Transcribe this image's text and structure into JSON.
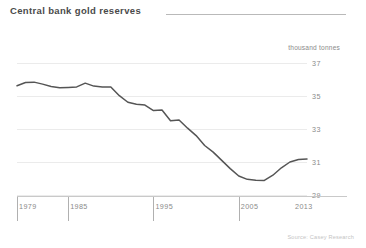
{
  "header": {
    "title": "Central bank gold reserves"
  },
  "footer": {
    "source": "Source: Casey Research"
  },
  "chart_data": {
    "type": "line",
    "title": "Central bank gold reserves",
    "subtitle": "",
    "xlabel": "",
    "ylabel": "thousand tonnes",
    "unit_label": "thousand tonnes",
    "legend": [],
    "legend_position": "none",
    "grid": true,
    "xlim": [
      1979,
      2013
    ],
    "ylim": [
      29,
      37
    ],
    "yticks": [
      37,
      35,
      33,
      31,
      29
    ],
    "ytick_labels": [
      "37",
      "35",
      "33",
      "31",
      "29"
    ],
    "xticks": [
      1979,
      1985,
      1995,
      2005,
      2013
    ],
    "xtick_labels": [
      "1979",
      "1985",
      "1995",
      "2005",
      "2013"
    ],
    "line_color": "#555555",
    "grid_color": "#ebebeb",
    "axis_color": "#c9c9c9",
    "x": [
      1979,
      1980,
      1981,
      1982,
      1983,
      1984,
      1985,
      1986,
      1987,
      1988,
      1989,
      1990,
      1991,
      1992,
      1993,
      1994,
      1995,
      1996,
      1997,
      1998,
      1999,
      2000,
      2001,
      2002,
      2003,
      2004,
      2005,
      2006,
      2007,
      2008,
      2009,
      2010,
      2011,
      2012,
      2013
    ],
    "values": [
      35.62,
      35.82,
      35.84,
      35.72,
      35.58,
      35.5,
      35.52,
      35.55,
      35.78,
      35.6,
      35.55,
      35.55,
      35.02,
      34.62,
      34.5,
      34.45,
      34.12,
      34.15,
      33.5,
      33.55,
      33.05,
      32.6,
      32.0,
      31.6,
      31.1,
      30.6,
      30.15,
      29.95,
      29.9,
      29.88,
      30.2,
      30.65,
      31.0,
      31.15,
      31.18
    ],
    "series": [
      {
        "name": "Central bank gold reserves",
        "values": [
          35.62,
          35.82,
          35.84,
          35.72,
          35.58,
          35.5,
          35.52,
          35.55,
          35.78,
          35.6,
          35.55,
          35.55,
          35.02,
          34.62,
          34.5,
          34.45,
          34.12,
          34.15,
          33.5,
          33.55,
          33.05,
          32.6,
          32.0,
          31.6,
          31.1,
          30.6,
          30.15,
          29.95,
          29.9,
          29.88,
          30.2,
          30.65,
          31.0,
          31.15,
          31.18
        ]
      }
    ]
  }
}
